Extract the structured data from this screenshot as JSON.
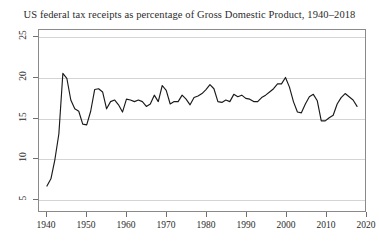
{
  "chart_data": {
    "type": "line",
    "title": "US federal tax receipts as percentage of Gross Domestic Product, 1940–2018",
    "xlabel": "",
    "ylabel": "",
    "xlim": [
      1938,
      2020
    ],
    "ylim": [
      3.4,
      25.9
    ],
    "grid": true,
    "legend": null,
    "line_color": "#1a1a1a",
    "x_ticks": [
      1940,
      1950,
      1960,
      1970,
      1980,
      1990,
      2000,
      2010,
      2020
    ],
    "x_tick_labels": [
      "1940",
      "1950",
      "1960",
      "1970",
      "1980",
      "1990",
      "2000",
      "2010",
      "2020"
    ],
    "y_ticks": [
      5,
      10,
      15,
      20,
      25
    ],
    "y_tick_labels": [
      "5",
      "10",
      "15",
      "20",
      "25"
    ],
    "x": [
      1940,
      1941,
      1942,
      1943,
      1944,
      1945,
      1946,
      1947,
      1948,
      1949,
      1950,
      1951,
      1952,
      1953,
      1954,
      1955,
      1956,
      1957,
      1958,
      1959,
      1960,
      1961,
      1962,
      1963,
      1964,
      1965,
      1966,
      1967,
      1968,
      1969,
      1970,
      1971,
      1972,
      1973,
      1974,
      1975,
      1976,
      1977,
      1978,
      1979,
      1980,
      1981,
      1982,
      1983,
      1984,
      1985,
      1986,
      1987,
      1988,
      1989,
      1990,
      1991,
      1992,
      1993,
      1994,
      1995,
      1996,
      1997,
      1998,
      1999,
      2000,
      2001,
      2002,
      2003,
      2004,
      2005,
      2006,
      2007,
      2008,
      2009,
      2010,
      2011,
      2012,
      2013,
      2014,
      2015,
      2016,
      2017,
      2018
    ],
    "values": [
      6.5,
      7.4,
      9.8,
      13.0,
      20.5,
      19.9,
      17.2,
      16.1,
      15.8,
      14.2,
      14.1,
      15.8,
      18.5,
      18.6,
      18.2,
      16.1,
      17.0,
      17.2,
      16.6,
      15.7,
      17.3,
      17.2,
      17.0,
      17.2,
      17.0,
      16.4,
      16.7,
      17.8,
      17.0,
      19.0,
      18.4,
      16.7,
      17.0,
      17.0,
      17.8,
      17.3,
      16.6,
      17.5,
      17.7,
      18.0,
      18.5,
      19.1,
      18.6,
      17.0,
      16.9,
      17.2,
      17.0,
      17.9,
      17.6,
      17.8,
      17.4,
      17.3,
      17.0,
      17.0,
      17.5,
      17.8,
      18.2,
      18.6,
      19.2,
      19.2,
      20.0,
      18.8,
      17.0,
      15.7,
      15.6,
      16.7,
      17.6,
      17.9,
      17.1,
      14.6,
      14.6,
      15.0,
      15.3,
      16.7,
      17.5,
      18.0,
      17.6,
      17.2,
      16.4
    ]
  }
}
